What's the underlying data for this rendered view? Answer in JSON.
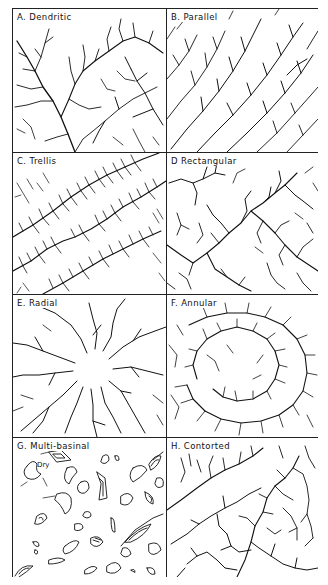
{
  "figure": {
    "panels": [
      {
        "id": "A",
        "label": "A.  Dendritic"
      },
      {
        "id": "B",
        "label": "B. Parallel"
      },
      {
        "id": "C",
        "label": "C.  Trellis"
      },
      {
        "id": "D",
        "label": "D  Rectangular"
      },
      {
        "id": "E",
        "label": "E.  Radial"
      },
      {
        "id": "F",
        "label": "F.  Annular"
      },
      {
        "id": "G",
        "label": "G.  Multi-basinal",
        "annotation": "Dry"
      },
      {
        "id": "H",
        "label": "H.  Contorted"
      }
    ]
  },
  "colors": {
    "ink": "#111111",
    "background": "#ffffff",
    "border": "#222222"
  }
}
